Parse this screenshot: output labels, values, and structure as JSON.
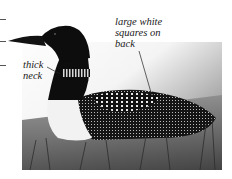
{
  "figure": {
    "annotations": [
      {
        "id": "back",
        "text_lines": [
          "large white",
          "squares on",
          "back"
        ]
      },
      {
        "id": "neck",
        "text_lines": [
          "thick",
          "neck"
        ]
      }
    ],
    "colors": {
      "background": "#ffffff",
      "bird_dark": "#0d0d0d",
      "bird_white": "#f2f2f2",
      "grass": "#6b6b6b",
      "text": "#1a1a1a"
    }
  }
}
